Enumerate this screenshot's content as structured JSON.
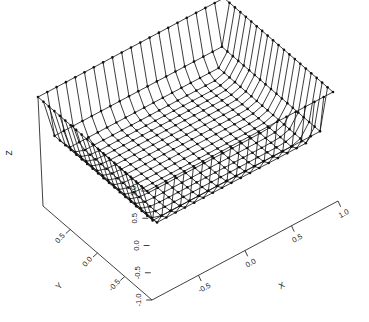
{
  "figure": {
    "background": "#ffffff",
    "ink_color": "#1a1a1a"
  },
  "axes": {
    "x": {
      "label": "X",
      "ticks": [
        "-0.5",
        "0.0",
        "0.5",
        "1.0"
      ],
      "range": [
        -1.0,
        1.0
      ]
    },
    "y": {
      "label": "Y",
      "ticks": [
        "0.5",
        "0.0",
        "-0.5"
      ],
      "range": [
        -1.0,
        1.0
      ]
    },
    "z": {
      "label": "Z",
      "ticks": [
        "1.0",
        "0.5",
        "0.0",
        "-0.5",
        "-1.0"
      ],
      "range": [
        -1.0,
        1.0
      ]
    }
  },
  "chart_data": {
    "type": "line",
    "title": "",
    "xlabel": "X",
    "ylabel": "Y",
    "zlabel": "Z",
    "plot_style": "3d-wireframe-surface",
    "marker": "dot",
    "marker_size": 1.3,
    "grid": false,
    "legend": null,
    "xlim": [
      -1.0,
      1.0
    ],
    "ylim": [
      -1.0,
      1.0
    ],
    "zlim": [
      -1.0,
      1.0
    ],
    "xticks": [
      -0.5,
      0.0,
      0.5,
      1.0
    ],
    "yticks": [
      0.5,
      0.0,
      -0.5
    ],
    "zticks": [
      1.0,
      0.5,
      0.0,
      -0.5,
      -1.0
    ],
    "view": {
      "azimuth": -52,
      "elevation": 22
    },
    "surface": {
      "description": "Steep-walled flat-bottomed well: z is near 0 over the interior and rises sharply to +/-1 at the x and y boundaries",
      "nx": 21,
      "ny": 21,
      "x": [
        -1.0,
        -0.9,
        -0.8,
        -0.7,
        -0.6,
        -0.5,
        -0.4,
        -0.3,
        -0.2,
        -0.1,
        0.0,
        0.1,
        0.2,
        0.3,
        0.4,
        0.5,
        0.6,
        0.7,
        0.8,
        0.9,
        1.0
      ],
      "y": [
        -1.0,
        -0.9,
        -0.8,
        -0.7,
        -0.6,
        -0.5,
        -0.4,
        -0.3,
        -0.2,
        -0.1,
        0.0,
        0.1,
        0.2,
        0.3,
        0.4,
        0.5,
        0.6,
        0.7,
        0.8,
        0.9,
        1.0
      ],
      "formula": "z = max(|x|,|y|)^12",
      "z_edge_max": 1.0,
      "z_center": 0.0
    }
  }
}
